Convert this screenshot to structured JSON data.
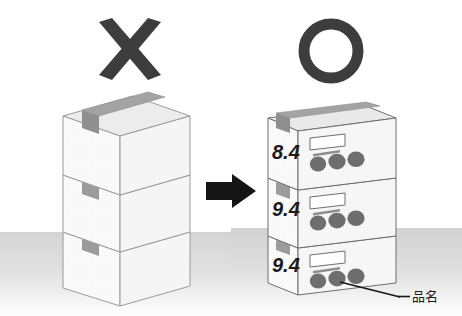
{
  "figure": {
    "background_color": "#ffffff",
    "ground_color": "#d8d8d8"
  },
  "marks": {
    "bad": {
      "symbol": "cross-mark",
      "glyph": "✕",
      "color": "#3a3a3a",
      "meaning": "incorrect"
    },
    "good": {
      "symbol": "circle-mark",
      "glyph": "○",
      "color": "#3a3a3a",
      "meaning": "correct"
    }
  },
  "arrow": {
    "name": "right-arrow",
    "color": "#1a1a1a",
    "direction": "right"
  },
  "left_stack": {
    "name": "unlabeled-carton-stack",
    "description": "Three plain cartons with no printed markings",
    "box_count": 3,
    "face_color": "#fbfbfb",
    "top_color": "#ededed",
    "side_color": "#f3f3f3",
    "tape_color": "#9a9a9a",
    "outline_color": "#8a8a8a",
    "boxes": [
      {
        "position": "top",
        "number": "",
        "has_label": false
      },
      {
        "position": "middle",
        "number": "",
        "has_label": false
      },
      {
        "position": "bottom",
        "number": "",
        "has_label": false
      }
    ]
  },
  "right_stack": {
    "name": "labeled-carton-stack",
    "description": "Three cartons printed with lot numbers and product marks",
    "box_count": 3,
    "face_color": "#fbfbfb",
    "top_color": "#ebebeb",
    "side_color": "#f4f4f4",
    "tape_color": "#9a9a9a",
    "outline_color": "#6e6e6e",
    "dot_color": "#6b6b6b",
    "boxes": [
      {
        "position": "top",
        "number": "8.4",
        "has_label": true,
        "label_box": "blank-print-box",
        "mark_count": 3
      },
      {
        "position": "middle",
        "number": "9.4",
        "has_label": true,
        "label_box": "blank-print-box",
        "mark_count": 3
      },
      {
        "position": "bottom",
        "number": "9.4",
        "has_label": true,
        "label_box": "blank-print-box",
        "mark_count": 3
      }
    ]
  },
  "annotation": {
    "name": "product-name-callout",
    "text": "品名",
    "meaning": "product name",
    "leader_line": true,
    "color": "#1a1a1a"
  }
}
